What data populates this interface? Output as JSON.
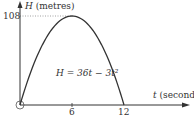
{
  "chart_data": {
    "type": "line",
    "title": "",
    "xlabel": "t (seconds)",
    "ylabel": "H (metres)",
    "xlabel_var": "t",
    "xlabel_unit": "(seconds)",
    "ylabel_var": "H",
    "ylabel_unit": "(metres)",
    "equation": "H = 36t − 3t²",
    "x_ticks": [
      "6",
      "12"
    ],
    "y_ticks": [
      "108"
    ],
    "xlim": [
      0,
      13
    ],
    "ylim": [
      0,
      115
    ],
    "grid": false,
    "annotations": [
      "H = 36t − 3t²"
    ],
    "series": [
      {
        "name": "H = 36t − 3t²",
        "x": [
          0,
          1,
          2,
          3,
          4,
          5,
          6,
          7,
          8,
          9,
          10,
          11,
          12
        ],
        "values": [
          0,
          33,
          60,
          81,
          96,
          105,
          108,
          105,
          96,
          81,
          60,
          33,
          0
        ]
      }
    ],
    "reference_lines": [
      {
        "type": "horizontal-dotted",
        "y": 108,
        "x_from": 0,
        "x_to": 6
      }
    ],
    "origin_marker": "circle"
  },
  "colors": {
    "axis": "#333333",
    "curve": "#333333",
    "dotted": "#888888"
  }
}
